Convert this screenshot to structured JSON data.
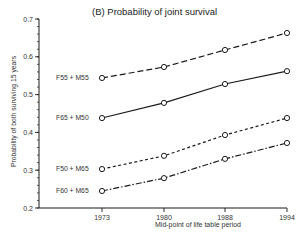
{
  "chart_data": {
    "type": "line",
    "title": "(B) Probability of joint survival",
    "xlabel": "Mid-point of life table period",
    "ylabel": "Probability of both surviving 15 years",
    "x": [
      1973,
      1980,
      1988,
      1994
    ],
    "x_tick_labels": [
      "1973",
      "1980",
      "1988",
      "1994"
    ],
    "ylim": [
      0.2,
      0.7
    ],
    "y_ticks": [
      0.2,
      0.3,
      0.4,
      0.5,
      0.6,
      0.7
    ],
    "y_tick_labels": [
      "0.2",
      "0.3",
      "0.4",
      "0.5",
      "0.6",
      "0.7"
    ],
    "y_minor_step": 0.02,
    "grid": false,
    "legend": "inline labels at left of each series",
    "series": [
      {
        "name": "F55 + M55",
        "style": "long-dash",
        "values": [
          0.544,
          0.573,
          0.618,
          0.663
        ]
      },
      {
        "name": "F65 + M50",
        "style": "solid",
        "values": [
          0.438,
          0.478,
          0.528,
          0.562
        ]
      },
      {
        "name": "F50 + M65",
        "style": "short-dash",
        "values": [
          0.303,
          0.338,
          0.393,
          0.438
        ]
      },
      {
        "name": "F60 + M65",
        "style": "dash-dot",
        "values": [
          0.245,
          0.279,
          0.33,
          0.372
        ]
      }
    ]
  },
  "colors": {
    "line": "#1a1a1a",
    "marker_fill": "#ffffff",
    "text": "#222222"
  }
}
